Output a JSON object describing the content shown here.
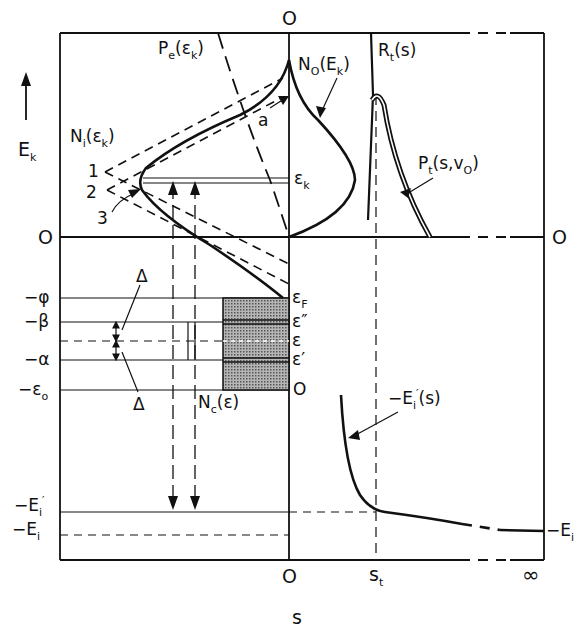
{
  "diagram": {
    "type": "energy-level / tunneling schematic",
    "axes": {
      "vertical_label": "E",
      "vertical_label_sub": "k",
      "horizontal_label": "s",
      "top_zero": "O",
      "left_zero": "O",
      "right_zero": "O",
      "bottom_ticks": [
        "O",
        "s",
        "∞"
      ],
      "bottom_tick_s_sub": "t"
    },
    "curve_labels": {
      "pe": {
        "main": "P",
        "sub": "e",
        "arg": "(ε",
        "arg_sub": "k",
        "close": ")"
      },
      "no": {
        "main": "N",
        "sub": "O",
        "arg": "(E",
        "arg_sub": "k",
        "close": ")"
      },
      "rt": {
        "main": "R",
        "sub": "t",
        "arg": "(s)"
      },
      "ni": {
        "main": "N",
        "sub": "i",
        "arg": "(ε",
        "arg_sub": "k",
        "close": ")"
      },
      "pt": {
        "main": "P",
        "sub": "t",
        "arg": "(s,v",
        "arg_sub": "O",
        "close": ")"
      },
      "ei_prime_s": {
        "main": "−E",
        "sub": "i",
        "sup": "′",
        "arg": "(s)"
      },
      "nc": {
        "main": "N",
        "sub": "c",
        "arg": "(ε)"
      },
      "a": "a",
      "eps_k": {
        "main": "ε",
        "sub": "k"
      },
      "branch_1": "1",
      "branch_2": "2",
      "branch_3": "3",
      "delta_top": "Δ",
      "delta_bottom": "Δ"
    },
    "left_levels": [
      {
        "label": "−φ"
      },
      {
        "label": "−β"
      },
      {
        "label": "−α"
      },
      {
        "label": "−ε",
        "sub": "o"
      },
      {
        "label": "−E",
        "sub": "i",
        "sup": "′"
      },
      {
        "label": "−E",
        "sub": "i"
      }
    ],
    "band_levels": [
      {
        "label": "ε",
        "sub": "F"
      },
      {
        "label": "ε″"
      },
      {
        "label": "ε"
      },
      {
        "label": "ε′"
      },
      {
        "label": "O"
      }
    ],
    "right_level": {
      "label": "−E",
      "sub": "i"
    },
    "colors": {
      "ink": "#111111",
      "band_fill": "#9a9a9a",
      "background": "#ffffff"
    }
  }
}
